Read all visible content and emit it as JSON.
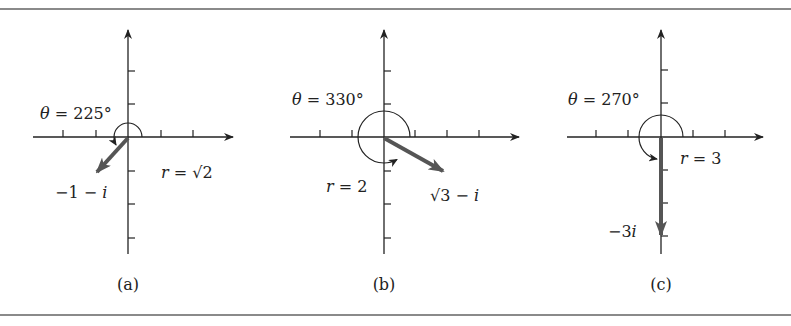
{
  "figure": {
    "rule_color": "#8a8a8a",
    "axis_color": "#222222",
    "vector_color": "#555555",
    "panels": [
      {
        "id": "a",
        "caption": "(a)",
        "theta_label": "θ = 225°",
        "r_label": "r = √2",
        "z_label": "−1 − i",
        "theta_deg": 225,
        "r": "√2",
        "z": "−1 − i"
      },
      {
        "id": "b",
        "caption": "(b)",
        "theta_label": "θ = 330°",
        "r_label": "r = 2",
        "z_label": "√3 − i",
        "theta_deg": 330,
        "r": "2",
        "z": "√3 − i"
      },
      {
        "id": "c",
        "caption": "(c)",
        "theta_label": "θ = 270°",
        "r_label": "r = 3",
        "z_label": "−3i",
        "theta_deg": 270,
        "r": "3",
        "z": "−3i"
      }
    ]
  }
}
